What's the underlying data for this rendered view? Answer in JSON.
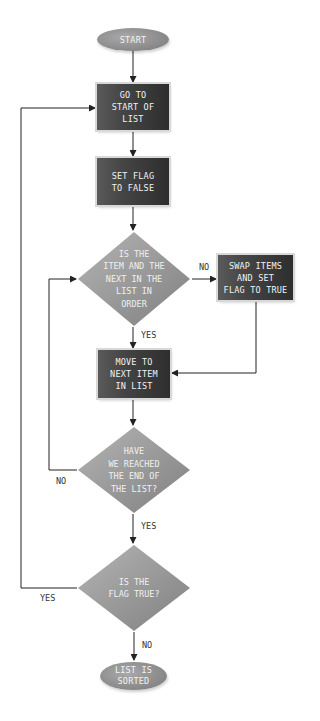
{
  "diagram": {
    "type": "flowchart",
    "colors": {
      "process_box": "#3c3c3c",
      "decision": "#9a9a9a",
      "terminal": "#8c8c8c",
      "line": "#222222",
      "text": "#f2f2f2",
      "edge_label": "#333333"
    },
    "nodes": {
      "start": {
        "shape": "terminal",
        "text": "START"
      },
      "go_to_start": {
        "shape": "process",
        "text": "GO TO\nSTART OF\nLIST"
      },
      "set_flag_false": {
        "shape": "process",
        "text": "SET FLAG\nTO FALSE"
      },
      "is_in_order": {
        "shape": "decision",
        "text": "IS THE\nITEM AND THE\nNEXT IN THE\nLIST IN\nORDER"
      },
      "swap_items": {
        "shape": "process",
        "text": "SWAP ITEMS\nAND SET\nFLAG TO TRUE"
      },
      "move_next": {
        "shape": "process",
        "text": "MOVE TO\nNEXT ITEM\nIN LIST"
      },
      "reached_end": {
        "shape": "decision",
        "text": "HAVE\nWE REACHED\nTHE END OF\nTHE LIST?"
      },
      "flag_true": {
        "shape": "decision",
        "text": "IS THE\nFLAG TRUE?"
      },
      "sorted": {
        "shape": "terminal",
        "text": "LIST IS\nSORTED"
      }
    },
    "edges": [
      {
        "from": "start",
        "to": "go_to_start",
        "label": ""
      },
      {
        "from": "go_to_start",
        "to": "set_flag_false",
        "label": ""
      },
      {
        "from": "set_flag_false",
        "to": "is_in_order",
        "label": ""
      },
      {
        "from": "is_in_order",
        "to": "swap_items",
        "label": "NO"
      },
      {
        "from": "is_in_order",
        "to": "move_next",
        "label": "YES"
      },
      {
        "from": "swap_items",
        "to": "move_next",
        "label": ""
      },
      {
        "from": "move_next",
        "to": "reached_end",
        "label": ""
      },
      {
        "from": "reached_end",
        "to": "is_in_order",
        "label": "NO"
      },
      {
        "from": "reached_end",
        "to": "flag_true",
        "label": "YES"
      },
      {
        "from": "flag_true",
        "to": "go_to_start",
        "label": "YES"
      },
      {
        "from": "flag_true",
        "to": "sorted",
        "label": "NO"
      }
    ],
    "edge_labels": {
      "in_order_no": "NO",
      "in_order_yes": "YES",
      "reached_end_no": "NO",
      "reached_end_yes": "YES",
      "flag_true_yes": "YES",
      "flag_true_no": "NO"
    }
  }
}
